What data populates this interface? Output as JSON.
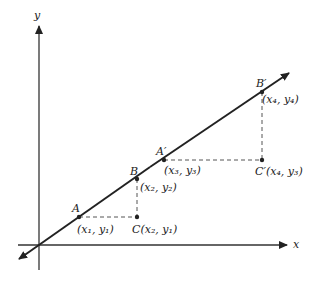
{
  "diagram": {
    "axes": {
      "x_label": "x",
      "y_label": "y"
    },
    "line": {
      "description": "straight line through origin with points A, B, A', B'"
    },
    "points": [
      {
        "id": "A",
        "label": "A",
        "coord": "(x₁, y₁)"
      },
      {
        "id": "B",
        "label": "B",
        "coord": "(x₂, y₂)"
      },
      {
        "id": "C",
        "label": "C",
        "coord": "C(x₂, y₁)"
      },
      {
        "id": "A_prime",
        "label": "A′",
        "coord": "(x₃, y₃)"
      },
      {
        "id": "B_prime",
        "label": "B′",
        "coord": "(x₄, y₄)"
      },
      {
        "id": "C_prime",
        "label": "C′",
        "coord": "C′(x₄, y₃)"
      }
    ],
    "colors": {
      "ink": "#222222",
      "dashed": "#555555",
      "background": "#ffffff"
    }
  }
}
